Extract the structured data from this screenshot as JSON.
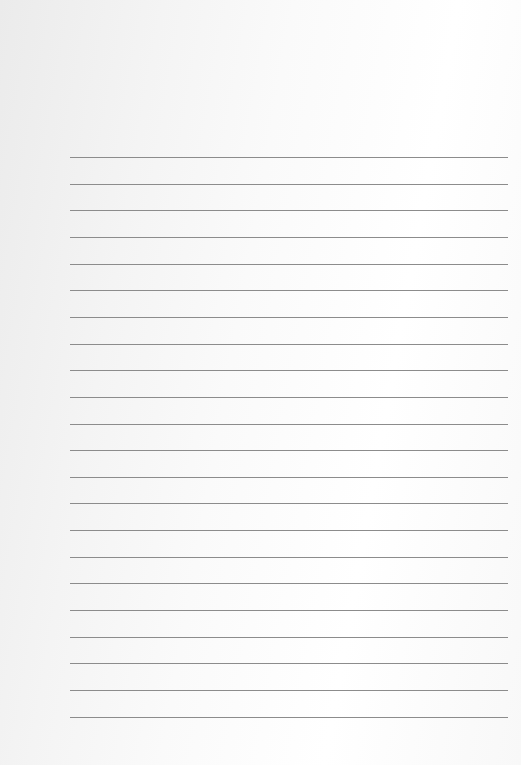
{
  "page": {
    "type": "lined-paper",
    "background_color": "#fafafa",
    "line_color": "#8c8c8c",
    "line_count": 22,
    "first_line_y": 157,
    "line_spacing": 26.65,
    "line_left": 70,
    "line_width": 438
  }
}
